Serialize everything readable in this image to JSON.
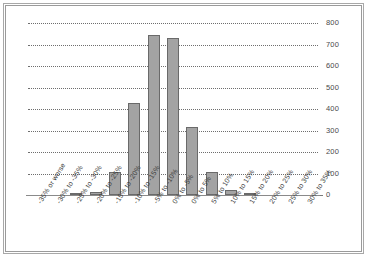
{
  "chart_data": {
    "type": "bar",
    "title": "",
    "subtitle": "",
    "xlabel": "",
    "ylabel": "",
    "ylim": [
      0,
      800
    ],
    "ytick_step": 100,
    "grid": true,
    "legend": false,
    "bar_color": "#a3a3a3",
    "bar_border_color": "#6a6a6a",
    "gridline_color": "#6e6e6e",
    "categories": [
      "-35% or worse",
      "-30% to -35%",
      "-25% to -30%",
      "-20% to -25%",
      "-15% to -20%",
      "-10% to -15%",
      "-5% to -10%",
      "0% to -5%",
      "0% to 5%",
      "5% to 10%",
      "10% to 15%",
      "15% to 20%",
      "20% to 25%",
      "25% to 30%",
      "30% to 35%"
    ],
    "values": [
      0,
      0,
      8,
      15,
      105,
      430,
      745,
      730,
      318,
      105,
      25,
      10,
      0,
      0,
      0
    ],
    "ytick_labels": [
      "800",
      "700",
      "600",
      "500",
      "400",
      "300",
      "200",
      "100",
      "0"
    ],
    "ytick_values": [
      800,
      700,
      600,
      500,
      400,
      300,
      200,
      100,
      0
    ]
  }
}
